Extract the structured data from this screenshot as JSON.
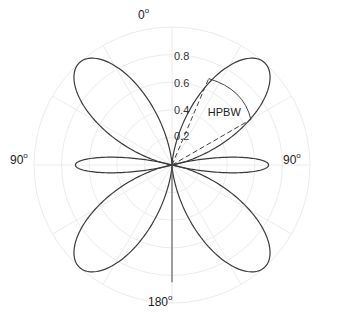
{
  "chart_data": {
    "type": "polar",
    "title": "",
    "angle_labels": [
      {
        "text": "0",
        "unit": "o",
        "angle": 0
      },
      {
        "text": "90",
        "unit": "o",
        "angle": -90
      },
      {
        "text": "90",
        "unit": "o",
        "angle": 90
      },
      {
        "text": "180",
        "unit": "o",
        "angle": 180
      }
    ],
    "radial_ticks": [
      "0.2",
      "0.4",
      "0.6",
      "0.8"
    ],
    "radial_values": [
      0.2,
      0.4,
      0.6,
      0.8,
      1.0
    ],
    "rlim": [
      0,
      1.0
    ],
    "grid": true,
    "angle_grid_step_deg": 30,
    "series": [
      {
        "name": "radiation pattern",
        "lobes": [
          {
            "center_deg": 42,
            "amplitude": 1.0,
            "half_width_deg": 40
          },
          {
            "center_deg": -42,
            "amplitude": 1.0,
            "half_width_deg": 40
          },
          {
            "center_deg": 138,
            "amplitude": 1.0,
            "half_width_deg": 40
          },
          {
            "center_deg": -138,
            "amplitude": 1.0,
            "half_width_deg": 40
          },
          {
            "center_deg": 90,
            "amplitude": 0.7,
            "half_width_deg": 16
          },
          {
            "center_deg": -90,
            "amplitude": 0.7,
            "half_width_deg": 16
          }
        ],
        "axis_line": {
          "angle_deg": 180,
          "length": 0.85
        }
      }
    ],
    "annotation": {
      "text": "HPBW",
      "dashed_rays_deg": [
        23,
        60
      ],
      "ray_length": [
        0.68,
        0.66
      ],
      "label_position": {
        "r": 0.52,
        "angle_deg": 44
      }
    }
  }
}
